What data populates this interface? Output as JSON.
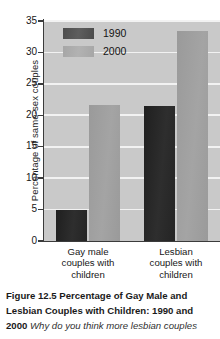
{
  "chart_data": {
    "type": "bar",
    "title": "Percentage of Gay Male and Lesbian Couples with Children: 1990 and 2000",
    "xlabel": "",
    "ylabel": "Percentage of same-sex couples",
    "ylim": [
      0,
      35
    ],
    "ytick_step": 5,
    "yticks": [
      "35",
      "30",
      "25",
      "20",
      "15",
      "10",
      "5",
      "0"
    ],
    "grid": true,
    "legend_position": "top-left-inside",
    "categories": [
      "Gay male couples with children",
      "Lesbian couples with children"
    ],
    "category_lines": [
      [
        "Gay male",
        "couples with",
        "children"
      ],
      [
        "Lesbian",
        "couples with",
        "children"
      ]
    ],
    "series": [
      {
        "name": "1990",
        "values": [
          5.0,
          21.5
        ],
        "color": "#2a2a2a"
      },
      {
        "name": "2000",
        "values": [
          21.6,
          33.4
        ],
        "color": "#9d9d9d"
      }
    ]
  },
  "legend": {
    "items": [
      {
        "label": "1990"
      },
      {
        "label": "2000"
      }
    ]
  },
  "caption": {
    "figure_number": "Figure 12.5",
    "title": "Percentage of Gay Male and Lesbian Couples with Children: 1990 and 2000",
    "line1_bold": "Figure 12.5  Percentage of Gay Male and",
    "line2_bold": "Lesbian Couples with Children: 1990 and",
    "line3_bold": "2000",
    "line3_italic": "Why do you think more lesbian couples"
  },
  "colors": {
    "series_1990": "#2a2a2a",
    "series_2000": "#9d9d9d",
    "plot_background": "#c9c9c9",
    "gridline": "#f2f2f2",
    "axis": "#3b3b3b",
    "page_background": "#ffffff"
  }
}
